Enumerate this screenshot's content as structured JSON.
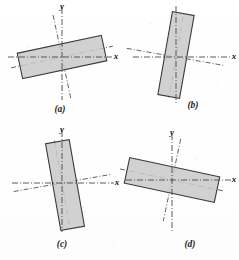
{
  "figure": {
    "name": "principal-axes-of-rectangular-laminas",
    "width": 239,
    "height": 260,
    "background_color": "#ffffff",
    "style": "scanned-textbook-line-drawing"
  },
  "appearance": {
    "shape_fill": "#c9c9c9",
    "shape_stroke": "#3a3a3a",
    "axis_stroke": "#4a4a4a",
    "principal_axis_stroke": "#4a4a4a",
    "label_color": "#141414",
    "axis_dash_pattern": "6 2 1 2",
    "principal_dash_pattern": "5 2 1 2"
  },
  "labels": {
    "y_axis": "y",
    "x_axis": "x"
  },
  "panels": [
    {
      "id": "a",
      "caption": "(a)",
      "caption_x": 60,
      "caption_y": 112,
      "origin": {
        "x": 62,
        "y": 57
      },
      "x_axis": {
        "x1": 8,
        "y1": 57,
        "x2": 112,
        "y2": 57
      },
      "y_axis": {
        "x1": 62,
        "y1": 8,
        "x2": 62,
        "y2": 100
      },
      "y_label": {
        "x": 62,
        "y": 9,
        "text": "y"
      },
      "x_label": {
        "x": 116,
        "y": 59,
        "text": "x"
      },
      "rect": {
        "cx": 62,
        "cy": 57,
        "width": 86,
        "height": 26,
        "rotation_deg": -12
      },
      "principal_axes": {
        "rotation_deg": -12,
        "u": {
          "length": 104
        },
        "v": {
          "length": 86
        }
      }
    },
    {
      "id": "b",
      "caption": "(b)",
      "caption_x": 193,
      "caption_y": 108,
      "origin": {
        "x": 176,
        "y": 57
      },
      "x_axis": {
        "x1": 133,
        "y1": 57,
        "x2": 232,
        "y2": 57
      },
      "y_axis": {
        "x1": 176,
        "y1": 6,
        "x2": 176,
        "y2": 104
      },
      "y_label": null,
      "x_label": {
        "x": 234,
        "y": 59,
        "text": "x"
      },
      "rect": {
        "cx": 176,
        "cy": 55,
        "width": 22,
        "height": 84,
        "rotation_deg": 10
      },
      "principal_axes": {
        "rotation_deg": 10,
        "u": {
          "length": 100
        },
        "v": {
          "length": 82
        }
      }
    },
    {
      "id": "c",
      "caption": "(c)",
      "caption_x": 62,
      "caption_y": 247,
      "origin": {
        "x": 62,
        "y": 183
      },
      "x_axis": {
        "x1": 12,
        "y1": 183,
        "x2": 114,
        "y2": 183
      },
      "y_axis": {
        "x1": 62,
        "y1": 131,
        "x2": 62,
        "y2": 232
      },
      "y_label": {
        "x": 62,
        "y": 132,
        "text": "y"
      },
      "x_label": {
        "x": 117,
        "y": 185,
        "text": "x"
      },
      "rect": {
        "cx": 65,
        "cy": 185,
        "width": 24,
        "height": 88,
        "rotation_deg": -10
      },
      "principal_axes": {
        "rotation_deg": -10,
        "u": {
          "length": 98
        },
        "v": {
          "length": 86
        }
      }
    },
    {
      "id": "d",
      "caption": "(d)",
      "caption_x": 190,
      "caption_y": 247,
      "origin": {
        "x": 172,
        "y": 180
      },
      "x_axis": {
        "x1": 126,
        "y1": 180,
        "x2": 232,
        "y2": 180
      },
      "y_axis": {
        "x1": 172,
        "y1": 134,
        "x2": 172,
        "y2": 232
      },
      "y_label": {
        "x": 172,
        "y": 135,
        "text": "y"
      },
      "x_label": {
        "x": 234,
        "y": 182,
        "text": "x"
      },
      "rect": {
        "cx": 172,
        "cy": 180,
        "width": 92,
        "height": 26,
        "rotation_deg": 12
      },
      "principal_axes": {
        "rotation_deg": 12,
        "u": {
          "length": 106
        },
        "v": {
          "length": 84
        }
      }
    }
  ]
}
